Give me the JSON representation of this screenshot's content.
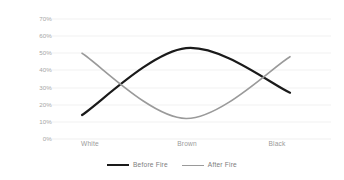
{
  "chart_data": {
    "type": "line",
    "title": "",
    "subtitle": "",
    "xlabel": "",
    "ylabel": "",
    "categories": [
      "White",
      "Brown",
      "Black"
    ],
    "ylim": [
      0,
      70
    ],
    "ytick_values": [
      70,
      60,
      50,
      40,
      30,
      20,
      10,
      0
    ],
    "ytick_labels": [
      "70%",
      "60%",
      "50%",
      "40%",
      "30%",
      "20%",
      "10%",
      "0%"
    ],
    "grid": true,
    "grid_color": "#f2f2f2",
    "legend_position": "bottom",
    "smooth": true,
    "series": [
      {
        "name": "Before Fire",
        "color": "#1a1a1a",
        "width": 2.2,
        "values": [
          14,
          53,
          27
        ]
      },
      {
        "name": "After Fire",
        "color": "#9a9a9a",
        "width": 1.6,
        "values": [
          50,
          12,
          48
        ]
      }
    ]
  },
  "axis": {
    "y": {
      "t70": "70%",
      "t60": "60%",
      "t50": "50%",
      "t40": "40%",
      "t30": "30%",
      "t20": "20%",
      "t10": "10%",
      "t0": "0%"
    },
    "x": {
      "white": "White",
      "brown": "Brown",
      "black": "Black"
    }
  },
  "legend": {
    "before": "Before Fire",
    "after": "After Fire"
  }
}
